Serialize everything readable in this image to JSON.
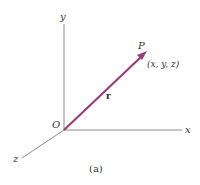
{
  "figure": {
    "caption": "(a)",
    "axes": {
      "x_label": "x",
      "y_label": "y",
      "z_label": "z",
      "origin_label": "O"
    },
    "vector": {
      "label": "r",
      "color": "#9b3d78"
    },
    "point": {
      "label": "P",
      "coordinates": "(x, y, z)"
    },
    "axis_color": "#8a8a8a"
  }
}
